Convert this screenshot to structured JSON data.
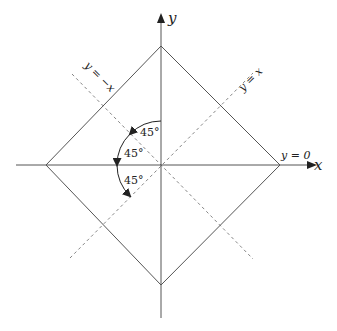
{
  "diagram": {
    "axes": {
      "x_label": "x",
      "y_label": "y"
    },
    "lines": {
      "y_eq_x": "y = x",
      "y_eq_neg_x": "y = −x",
      "y_eq_0": "y = 0"
    },
    "angles": [
      {
        "label": "45°"
      },
      {
        "label": "45°"
      },
      {
        "label": "45°"
      }
    ],
    "shape": "square rotated 45° (diamond) centered at origin",
    "colors": {
      "stroke": "#555555",
      "dashed": "#777777",
      "text": "#222222"
    }
  }
}
